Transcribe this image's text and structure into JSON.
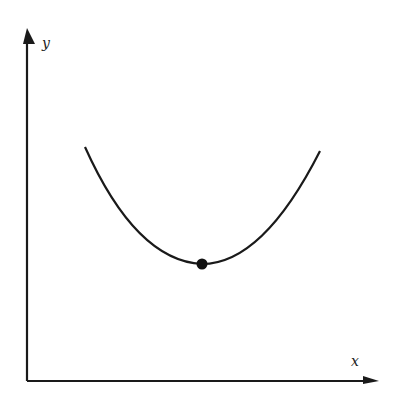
{
  "diagram": {
    "type": "convex-curve-with-minimum",
    "axes": {
      "x_label": "x",
      "y_label": "y"
    },
    "curve": {
      "shape": "U-shaped (convex) curve",
      "points": [
        [
          85,
          147
        ],
        [
          202,
          264
        ],
        [
          320,
          151
        ]
      ]
    },
    "marked_point": {
      "description": "minimum point",
      "position": [
        202,
        264
      ]
    },
    "colors": {
      "line": "#1a1a1a",
      "background": "#ffffff"
    }
  }
}
